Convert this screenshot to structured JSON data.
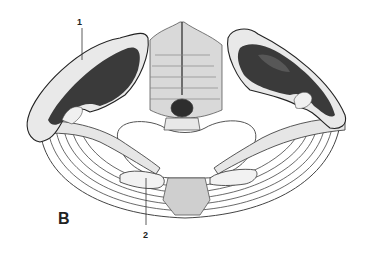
{
  "figure": {
    "panel_label": "B",
    "callouts": [
      {
        "id": "1",
        "text": "1"
      },
      {
        "id": "2",
        "text": "2"
      }
    ],
    "colors": {
      "background": "#ffffff",
      "ink": "#2a2a2a",
      "dark_fill": "#3a3a3a",
      "bone_fill": "#e8e8e8",
      "shading": "#bdbdbd"
    }
  }
}
